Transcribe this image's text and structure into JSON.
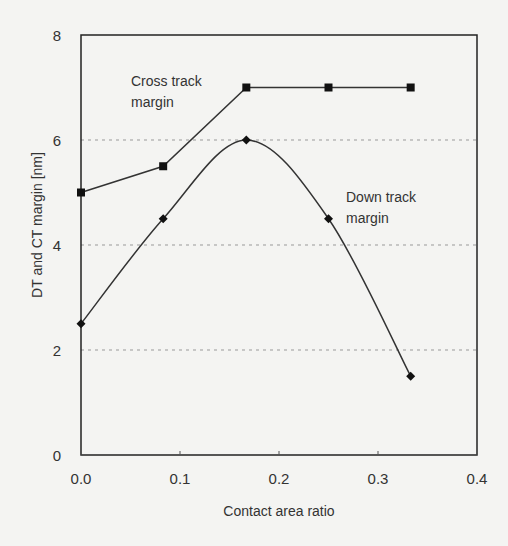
{
  "chart_data": {
    "type": "line",
    "title": "",
    "xlabel": "Contact area ratio",
    "ylabel": "DT and CT margin [nm]",
    "xlim": [
      0,
      0.4
    ],
    "ylim": [
      0,
      8
    ],
    "xticks": [
      0.0,
      0.1,
      0.2,
      0.3,
      0.4
    ],
    "xtick_labels": [
      "0.0",
      "0.1",
      "0.2",
      "0.3",
      "0.4"
    ],
    "yticks": [
      0,
      2,
      4,
      6,
      8
    ],
    "ytick_labels": [
      "0",
      "2",
      "4",
      "6",
      "8"
    ],
    "grid": "horizontal dotted at y=2,4,6",
    "series": [
      {
        "name": "Cross track margin",
        "marker": "square",
        "smooth": false,
        "x": [
          0.0,
          0.083,
          0.167,
          0.25,
          0.333
        ],
        "values": [
          5.0,
          5.5,
          7.0,
          7.0,
          7.0
        ],
        "annotation": [
          "Cross track",
          "margin"
        ]
      },
      {
        "name": "Down track margin",
        "marker": "diamond",
        "smooth": true,
        "x": [
          0.0,
          0.083,
          0.167,
          0.25,
          0.333
        ],
        "values": [
          2.5,
          4.5,
          6.0,
          4.5,
          1.5
        ],
        "annotation": [
          "Down track",
          "margin"
        ]
      }
    ]
  }
}
